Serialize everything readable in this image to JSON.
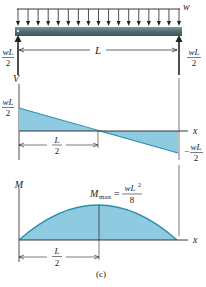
{
  "figure": {
    "caption": "(c)",
    "colors": {
      "beam": "#4f6c70",
      "beam_highlight": "#7e979a",
      "fill": "#8fcbe0",
      "curve": "#2a8fb0",
      "line": "#222222",
      "bg": "#ffffff"
    },
    "beam": {
      "load_label": "w",
      "span_label": "L",
      "left_reaction": {
        "num": "wL",
        "den": "2"
      },
      "right_reaction": {
        "num": "wL",
        "den": "2"
      },
      "load_arrow_count": 17
    },
    "shear_diagram": {
      "axis_label": "V",
      "x_label": "x",
      "max_label": {
        "num": "wL",
        "den": "2"
      },
      "min_label": {
        "sign": "−",
        "num": "wL",
        "den": "2"
      },
      "half_span": {
        "num": "L",
        "den": "2"
      }
    },
    "moment_diagram": {
      "axis_label": "M",
      "x_label": "x",
      "max_label": {
        "symbol": "M",
        "subscript": "max",
        "equals": "=",
        "num": "wL",
        "sup": "2",
        "den": "8"
      },
      "half_span": {
        "num": "L",
        "den": "2"
      }
    }
  }
}
